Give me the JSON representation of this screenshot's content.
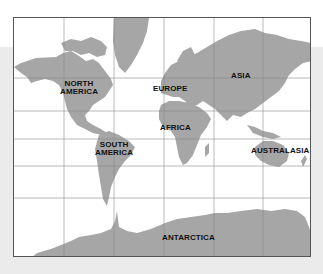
{
  "map": {
    "type": "world-map",
    "projection": "mercator",
    "land_color": "#a6a6a6",
    "water_color": "#ffffff",
    "grid_color": "#8c8c8c",
    "background_band_color": "#ebebeb",
    "labels": {
      "north_america_1": "NORTH",
      "north_america_2": "AMERICA",
      "south_america_1": "SOUTH",
      "south_america_2": "AMERICA",
      "europe": "EUROPE",
      "asia": "ASIA",
      "africa": "AFRICA",
      "australasia": "AUSTRALASIA",
      "antarctica": "ANTARCTICA"
    }
  }
}
